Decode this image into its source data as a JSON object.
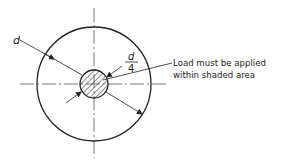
{
  "diagram": {
    "outer_diameter_label": "d",
    "inner_fraction": {
      "numerator": "d",
      "denominator": "4"
    },
    "annotation_line1": "Load must be applied",
    "annotation_line2": "within shaded area",
    "colors": {
      "stroke": "#222222",
      "centerline": "#555555",
      "background": "#ffffff"
    }
  }
}
